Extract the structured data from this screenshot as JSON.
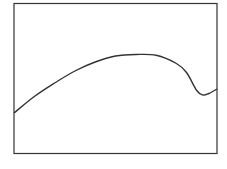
{
  "chart_data": {
    "type": "line",
    "title": "",
    "xlabel": "",
    "ylabel": "",
    "grid": false,
    "legend": null,
    "x": [
      0,
      0.1,
      0.2,
      0.3,
      0.4,
      0.5,
      0.6,
      0.7,
      0.8,
      0.85,
      0.9,
      0.93,
      0.96,
      1.0
    ],
    "series": [
      {
        "name": "curve",
        "values": [
          0.27,
          0.38,
          0.47,
          0.55,
          0.61,
          0.65,
          0.66,
          0.655,
          0.6,
          0.54,
          0.42,
          0.39,
          0.4,
          0.43
        ]
      }
    ],
    "xlim": [
      0,
      1
    ],
    "ylim": [
      0,
      1
    ],
    "colors": {
      "line": "#333333",
      "frame": "#333333",
      "background": "#ffffff"
    }
  }
}
